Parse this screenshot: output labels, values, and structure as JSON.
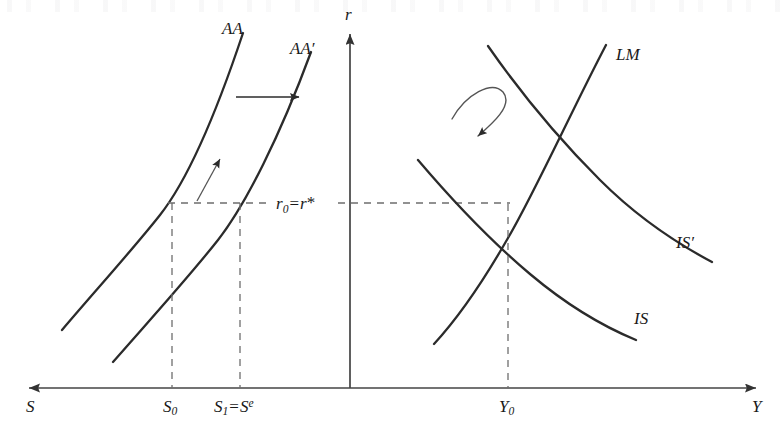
{
  "figure": {
    "width": 784,
    "height": 437,
    "background_color": "#ffffff",
    "line_color": "#2b2b2b",
    "dashed_color": "#6e6e6e",
    "text_color": "#1a1a1a"
  },
  "axes": {
    "vertical": {
      "label": "r",
      "label_name": "interest-rate-axis",
      "x": 350,
      "y_top": 28,
      "y_bottom": 388,
      "arrow": "up"
    },
    "horizontal_left": {
      "label": "S",
      "label_name": "saving-axis",
      "y": 388,
      "x_start": 23,
      "x_end": 350,
      "arrow": "left"
    },
    "horizontal_right": {
      "label": "Y",
      "label_name": "output-axis",
      "y": 388,
      "x_start": 350,
      "x_end": 762,
      "arrow": "right"
    }
  },
  "left_panel": {
    "name": "saving-investment-panel",
    "curves": [
      {
        "id": "AA",
        "label": "AA",
        "label_plain": "AA",
        "description": "initial saving schedule"
      },
      {
        "id": "AAp",
        "label": "AA",
        "label_prime": "′",
        "label_plain": "AA′",
        "description": "shifted saving schedule"
      }
    ],
    "arrows": [
      {
        "name": "horizontal-shift-arrow",
        "from_x": 236,
        "from_y": 97,
        "to_x": 301,
        "to_y": 97,
        "meaning": "rightward shift of AA"
      },
      {
        "name": "diagonal-shift-arrow",
        "from_x": 197,
        "from_y": 201,
        "to_x": 221,
        "to_y": 157,
        "meaning": "movement along schedule"
      }
    ],
    "ticks": [
      {
        "name": "tick-S0",
        "label": "S",
        "sub": "0",
        "label_plain": "S₀",
        "x": 172
      },
      {
        "name": "tick-S1",
        "label": "S",
        "sub": "1",
        "eq": "=",
        "label2": "S",
        "sup": "e",
        "label_plain": "S₁=Sᵉ",
        "x": 240
      }
    ]
  },
  "right_panel": {
    "name": "is-lm-panel",
    "curves": [
      {
        "id": "LM",
        "label": "LM",
        "label_plain": "LM",
        "description": "money market equilibrium, upward sloping"
      },
      {
        "id": "ISp",
        "label": "IS",
        "label_prime": "′",
        "label_plain": "IS′",
        "description": "shifted goods market schedule"
      },
      {
        "id": "IS",
        "label": "IS",
        "label_plain": "IS",
        "description": "initial goods market schedule"
      }
    ],
    "arrows": [
      {
        "name": "is-shift-curved-arrow",
        "meaning": "leftward shift of IS schedule"
      }
    ],
    "ticks": [
      {
        "name": "tick-Y0",
        "label": "Y",
        "sub": "0",
        "label_plain": "Y₀",
        "x": 508
      }
    ],
    "equilibrium": {
      "name": "equilibrium-point",
      "x": 508,
      "y": 204
    }
  },
  "rate_line": {
    "name": "equilibrium-rate-line",
    "y": 203,
    "label": "r",
    "sub": "0",
    "eq": "=",
    "label2": "r",
    "star": "*",
    "label_plain": "r₀=r*"
  }
}
